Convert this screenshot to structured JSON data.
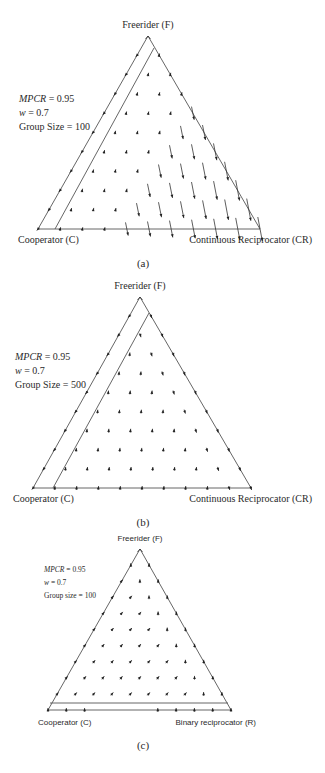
{
  "figure": {
    "panels": [
      {
        "id": "a",
        "caption": "(a)",
        "vertices": {
          "top": {
            "label": "Freerider (F)",
            "x": 148,
            "y": 36
          },
          "left": {
            "label": "Cooperator (C)",
            "x": 38,
            "y": 229
          },
          "right": {
            "label": "Continuous Reciprocator (CR)",
            "x": 260,
            "y": 229
          }
        },
        "params": {
          "mpcr_label": "MPCR",
          "mpcr_value": " = 0.95",
          "w_label": "w",
          "w_value": " = 0.7",
          "group_size": "Group Size = 100"
        },
        "inner_line": {
          "x1": 55,
          "y1": 229,
          "x2": 154,
          "y2": 48
        },
        "font": "serif"
      },
      {
        "id": "b",
        "caption": "(b)",
        "vertices": {
          "top": {
            "label": "Freerider (F)",
            "x": 140,
            "y": 297
          },
          "left": {
            "label": "Cooperator (C)",
            "x": 33,
            "y": 488
          },
          "right": {
            "label": "Continuous Reciprocator (CR)",
            "x": 251,
            "y": 488
          }
        },
        "params": {
          "mpcr_label": "MPCR",
          "mpcr_value": " = 0.95",
          "w_label": "w",
          "w_value": " = 0.7",
          "group_size": "Group Size = 500"
        },
        "inner_line": {
          "x1": 53,
          "y1": 488,
          "x2": 149,
          "y2": 313
        },
        "font": "serif"
      },
      {
        "id": "c",
        "caption": "(c)",
        "vertices": {
          "top": {
            "label": "Freerider (F)",
            "x": 140,
            "y": 549
          },
          "left": {
            "label": "Cooperator (C)",
            "x": 48,
            "y": 710
          },
          "right": {
            "label": "Binary reciprocator (R)",
            "x": 231,
            "y": 710
          }
        },
        "params": {
          "mpcr_label": "MPCR",
          "mpcr_value": " = 0.95",
          "w_label": "w",
          "w_value": " = 0.7",
          "group_size": "Group size = 100"
        },
        "inner_line": {
          "x1": 50,
          "y1": 703,
          "x2": 228,
          "y2": 703
        },
        "font": "sans"
      }
    ]
  },
  "chart_data": [
    {
      "type": "ternary-vector-field",
      "title": "(a)",
      "vertices": [
        "Freerider (F)",
        "Cooperator (C)",
        "Continuous Reciprocator (CR)"
      ],
      "annotations": [
        "MPCR = 0.95",
        "w = 0.7",
        "Group Size = 100"
      ],
      "description": "Arrows near C-F edge point toward C (down-left); short arrows in interior point slightly up; long arrows in the CR region point down toward the C–CR base, converging near CR.",
      "boundary_line": "line parallel to C–F edge separating a thin strip near the C–F edge"
    },
    {
      "type": "ternary-vector-field",
      "title": "(b)",
      "vertices": [
        "Freerider (F)",
        "Cooperator (C)",
        "Continuous Reciprocator (CR)"
      ],
      "annotations": [
        "MPCR = 0.95",
        "w = 0.7",
        "Group Size = 500"
      ],
      "description": "Arrows in strip near C–F edge point toward C; interior arrows short, pointing up toward F; arrows near F–CR edge point down toward CR.",
      "boundary_line": "line parallel to C–F edge"
    },
    {
      "type": "ternary-vector-field",
      "title": "(c)",
      "vertices": [
        "Freerider (F)",
        "Cooperator (C)",
        "Binary reciprocator (R)"
      ],
      "annotations": [
        "MPCR = 0.95",
        "w = 0.7",
        "Group size = 100"
      ],
      "description": "Interior arrows point up-left toward F; thin strip along C–R base with upward arrows.",
      "boundary_line": "line parallel to C–R base near the bottom"
    }
  ]
}
